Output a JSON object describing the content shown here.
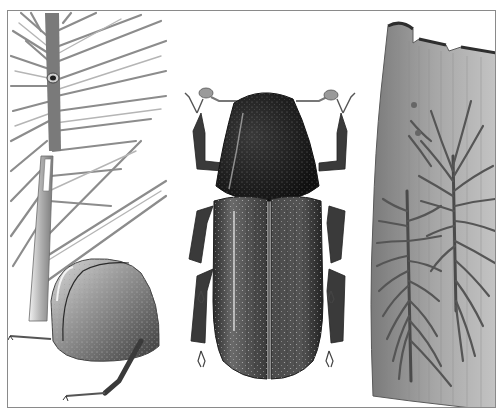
{
  "illustration": {
    "style": "monochrome stippled scientific illustration",
    "panels": [
      {
        "id": "pine-shoot",
        "subject": "pine shoot with bored entry hole"
      },
      {
        "id": "beetle-side",
        "subject": "bark beetle rear, lateral view"
      },
      {
        "id": "beetle-dorsal",
        "subject": "bark beetle, dorsal view"
      },
      {
        "id": "bark-galleries",
        "subject": "bark piece with beetle galleries"
      }
    ],
    "colors": {
      "background": "#ffffff",
      "frame": "#8a8a8a",
      "ink_dark": "#1e1e1e",
      "ink_mid": "#5a5a5a",
      "ink_light": "#a8a8a8",
      "bark": "#9a9a9a"
    }
  }
}
